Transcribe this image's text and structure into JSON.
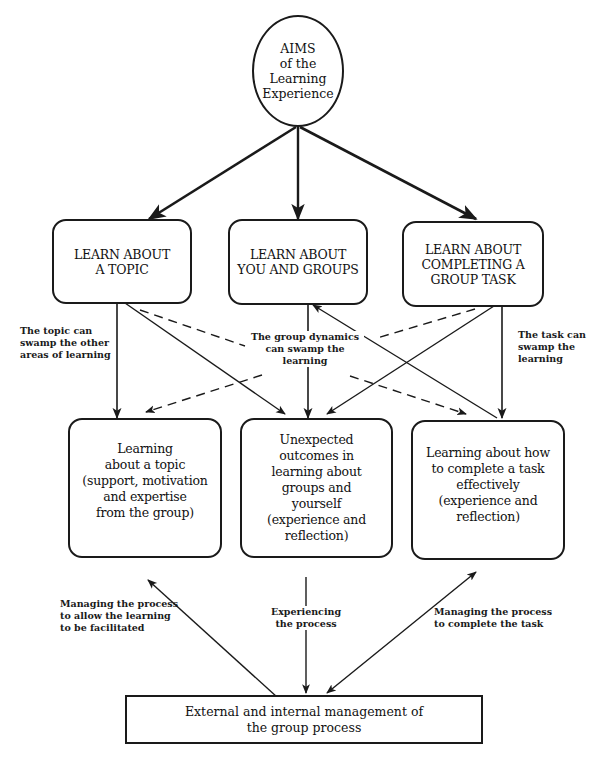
{
  "diagram": {
    "aim": {
      "lines": [
        "AIMS",
        "of the",
        "Learning",
        "Experience"
      ]
    },
    "learn_boxes": [
      {
        "id": "topic",
        "lines": [
          "LEARN ABOUT",
          "A TOPIC"
        ]
      },
      {
        "id": "groups",
        "lines": [
          "LEARN ABOUT",
          "YOU AND GROUPS"
        ]
      },
      {
        "id": "task",
        "lines": [
          "LEARN ABOUT",
          "COMPLETING A",
          "GROUP TASK"
        ]
      }
    ],
    "outcome_boxes": [
      {
        "id": "topic-outcome",
        "lines": [
          "Learning",
          "about a topic",
          "(support, motivation",
          "and expertise",
          "from the group)"
        ]
      },
      {
        "id": "groups-outcome",
        "lines": [
          "Unexpected",
          "outcomes in",
          "learning about",
          "groups and",
          "yourself",
          "(experience and",
          "reflection)"
        ]
      },
      {
        "id": "task-outcome",
        "lines": [
          "Learning about how",
          "to complete a task",
          "effectively",
          "(experience and",
          "reflection)"
        ]
      }
    ],
    "management_box": {
      "lines": [
        "External and internal management of",
        "the group process"
      ]
    },
    "annotations": {
      "topic_swamp": [
        "The topic can",
        "swamp the other",
        "areas of learning"
      ],
      "group_swamp": [
        "The group dynamics",
        "can swamp the",
        "learning"
      ],
      "task_swamp": [
        "The task can",
        "swamp the",
        "learning"
      ],
      "manage_learning": [
        "Managing the process",
        "to allow the learning",
        "to be facilitated"
      ],
      "experiencing": [
        "Experiencing",
        "the process"
      ],
      "manage_task": [
        "Managing the process",
        "to complete the task"
      ]
    },
    "colors": {
      "ink": "#1a1a1a",
      "background": "#ffffff"
    }
  }
}
